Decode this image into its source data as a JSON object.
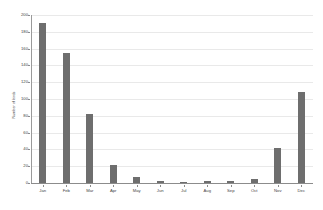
{
  "chart_data": {
    "type": "bar",
    "title": "",
    "xlabel": "",
    "ylabel": "Number of birds",
    "categories": [
      "Jan",
      "Feb",
      "Mar",
      "Apr",
      "May",
      "Jun",
      "Jul",
      "Aug",
      "Sep",
      "Oct",
      "Nov",
      "Dec"
    ],
    "values": [
      190,
      155,
      82,
      22,
      7,
      2,
      1,
      2,
      2,
      5,
      42,
      108
    ],
    "ylim": [
      0,
      200
    ],
    "yticks": [
      0,
      20,
      40,
      60,
      80,
      100,
      120,
      140,
      160,
      180,
      200
    ],
    "ytick_labels": [
      "0",
      "20",
      "40",
      "60",
      "80",
      "100",
      "120",
      "140",
      "160",
      "180",
      "200"
    ],
    "grid": true,
    "legend": "none",
    "bar_color": "#6e6e6e",
    "grid_color": "#e9e9e9",
    "axis_color": "#8c8c8c",
    "background": "#ffffff"
  }
}
